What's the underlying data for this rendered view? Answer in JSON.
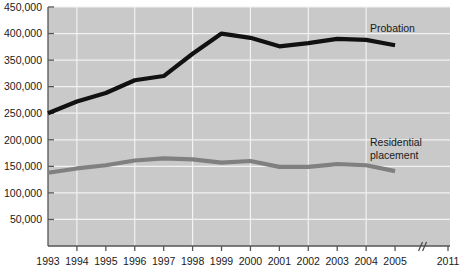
{
  "chart_data": {
    "type": "line",
    "title": "",
    "xlabel": "",
    "ylabel": "",
    "x": [
      1993,
      1994,
      1995,
      1996,
      1997,
      1998,
      1999,
      2000,
      2001,
      2002,
      2003,
      2004,
      2005
    ],
    "categories": [
      "1993",
      "1994",
      "1995",
      "1996",
      "1997",
      "1998",
      "1999",
      "2000",
      "2001",
      "2002",
      "2003",
      "2004",
      "2005"
    ],
    "xtick_labels": [
      "1993",
      "1994",
      "1995",
      "1996",
      "1997",
      "1998",
      "1999",
      "2000",
      "2001",
      "2002",
      "2003",
      "2004",
      "2005",
      "2011"
    ],
    "xlim": [
      1993,
      2005
    ],
    "ylim": [
      0,
      450000
    ],
    "ytick_labels": [
      "50,000",
      "100,000",
      "150,000",
      "200,000",
      "250,000",
      "300,000",
      "350,000",
      "400,000",
      "450,000"
    ],
    "ytick_values": [
      50000,
      100000,
      150000,
      200000,
      250000,
      300000,
      350000,
      400000,
      450000
    ],
    "grid": true,
    "legend_position": "inline-labels",
    "axis_break": {
      "label": "//",
      "between": [
        "2005",
        "2011"
      ]
    },
    "series": [
      {
        "name": "Probation",
        "color": "#111111",
        "line_width": 4.2,
        "values": [
          250000,
          272000,
          288000,
          312000,
          320000,
          362000,
          400000,
          392000,
          376000,
          382000,
          390000,
          388000,
          378000
        ]
      },
      {
        "name": "Residential placement",
        "color": "#808080",
        "line_width": 4.2,
        "values": [
          138000,
          146000,
          152000,
          161000,
          165000,
          163000,
          157000,
          160000,
          149000,
          149000,
          154000,
          152000,
          141000
        ]
      }
    ],
    "annotations": [
      {
        "text": "Probation",
        "series": "Probation",
        "x_px": 370,
        "y_px": 32
      },
      {
        "text": "Residential",
        "series": "Residential placement",
        "x_px": 370,
        "y_px": 146
      },
      {
        "text": "placement",
        "series": "Residential placement",
        "x_px": 370,
        "y_px": 159
      }
    ],
    "colors": {
      "plot_background": "#c9c9c9",
      "gridline": "#f2f2f2",
      "axis": "#555555",
      "probation": "#111111",
      "residential": "#808080",
      "page_background": "#ffffff"
    }
  }
}
